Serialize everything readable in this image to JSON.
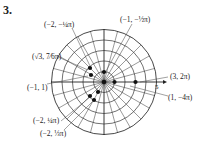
{
  "problem_number": "3.",
  "diagram": {
    "type": "polar-grid",
    "center": [
      104,
      82
    ],
    "rings": 5,
    "ring_spacing_px": 10.5,
    "radial_step_deg": 15,
    "axis_tick_label": "5",
    "line_color": "#333333",
    "point_color": "#111111"
  },
  "points": [
    {
      "label": "(3, 2π)",
      "r": 3,
      "theta": "2π"
    },
    {
      "label": "(1, −4π)",
      "r": 1,
      "theta": "−4π"
    },
    {
      "label": "(−1, −½π)",
      "r": -1,
      "theta": "−π/2"
    },
    {
      "label": "(−2, −¼π)",
      "r": -2,
      "theta": "−π/4"
    },
    {
      "label": "(√3, 7⁄6π)",
      "r": "√3",
      "theta": "7π/6"
    },
    {
      "label": "(−1, 1)",
      "r": -1,
      "theta": "1"
    },
    {
      "label": "(−2, ¼π)",
      "r": -2,
      "theta": "π/4"
    },
    {
      "label": "(−2, ⅓π)",
      "r": -2,
      "theta": "π/3"
    }
  ],
  "labels": {
    "p_neg2_negq": "(−2, −¼π)",
    "p_neg1_negh": "(−1, −½π)",
    "p_sqrt3": "(√3, 7⁄6π)",
    "p_3_2pi": "(3, 2π)",
    "p_1_neg4pi": "(1, −4π)",
    "p_neg1_1": "(−1, 1)",
    "p_neg2_q": "(−2, ¼π)",
    "p_neg2_t": "(−2, ⅓π)",
    "axis_five": "5"
  }
}
